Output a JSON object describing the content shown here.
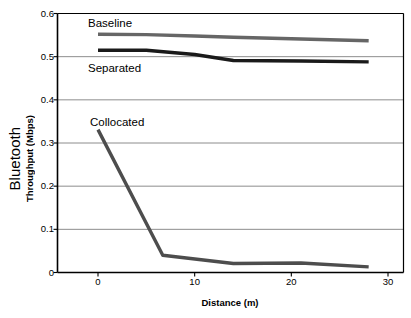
{
  "chart_data": {
    "type": "line",
    "title": "",
    "xlabel": "Distance (m)",
    "ylabel": "Bluetooth Throughput (Mbps)",
    "ylabel_main": "Bluetooth",
    "ylabel_sub": "Throughput (Mbps)",
    "xlim": [
      0,
      30
    ],
    "ylim": [
      0,
      0.6
    ],
    "xticks": [
      "0",
      "10",
      "20",
      "30"
    ],
    "xtick_values": [
      0,
      10,
      20,
      30
    ],
    "yticks": [
      "0",
      "0.1",
      "0.2",
      "0.3",
      "0.4",
      "0.5",
      "0.6"
    ],
    "ytick_values": [
      0,
      0.1,
      0.2,
      0.3,
      0.4,
      0.5,
      0.6
    ],
    "grid": "horizontal",
    "legend_position": "inline-annotations",
    "series": [
      {
        "name": "Baseline",
        "color": "#666666",
        "x": [
          0,
          5,
          10,
          14,
          21,
          28
        ],
        "values": [
          0.552,
          0.551,
          0.548,
          0.545,
          0.541,
          0.537
        ]
      },
      {
        "name": "Separated",
        "color": "#1a1a1a",
        "x": [
          0,
          5,
          10,
          14,
          21,
          28
        ],
        "values": [
          0.515,
          0.515,
          0.505,
          0.491,
          0.49,
          0.488
        ]
      },
      {
        "name": "Collocated",
        "color": "#4d4d4d",
        "x": [
          0,
          6.7,
          14,
          21,
          28
        ],
        "values": [
          0.331,
          0.04,
          0.021,
          0.022,
          0.013
        ]
      }
    ]
  },
  "axes": {
    "x_axis_label": "Distance (m)",
    "y_axis_label_main": "Bluetooth",
    "y_axis_label_sub": "Throughput (Mbps)"
  },
  "annotations": {
    "baseline": "Baseline",
    "separated": "Separated",
    "collocated": "Collocated"
  },
  "colors": {
    "baseline": "#666666",
    "separated": "#1a1a1a",
    "collocated": "#4d4d4d",
    "axis": "#000000",
    "grid": "#808080",
    "background": "#ffffff"
  }
}
